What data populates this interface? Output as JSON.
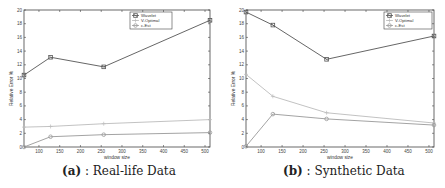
{
  "chart_data": [
    {
      "type": "line",
      "panel": "a",
      "title": "",
      "xlabel": "window size",
      "ylabel": "Relative Error %",
      "x": [
        64,
        128,
        256,
        512
      ],
      "xlim": [
        64,
        512
      ],
      "ylim": [
        0,
        20
      ],
      "xticks": [
        100,
        150,
        200,
        250,
        300,
        350,
        400,
        450,
        500
      ],
      "yticks": [
        0,
        2,
        4,
        6,
        8,
        10,
        12,
        14,
        16,
        18,
        20
      ],
      "grid": false,
      "legend_position": "upper center",
      "series": [
        {
          "name": "Wavelet",
          "values": [
            10.5,
            13.1,
            11.7,
            18.5
          ],
          "color": "#555555",
          "marker": "square"
        },
        {
          "name": "V-Optimal",
          "values": [
            2.9,
            3.0,
            3.4,
            4.0
          ],
          "color": "#bbbbbb",
          "marker": "plus"
        },
        {
          "name": "c-Est",
          "values": [
            0.0,
            1.5,
            1.8,
            2.1
          ],
          "color": "#999999",
          "marker": "circle"
        }
      ],
      "caption_label": "(a)",
      "caption_text": ": Real-life Data"
    },
    {
      "type": "line",
      "panel": "b",
      "title": "",
      "xlabel": "window size",
      "ylabel": "Relative Error %",
      "x": [
        64,
        128,
        256,
        512
      ],
      "xlim": [
        64,
        512
      ],
      "ylim": [
        0,
        20
      ],
      "xticks": [
        100,
        150,
        200,
        250,
        300,
        350,
        400,
        450,
        500
      ],
      "yticks": [
        0,
        2,
        4,
        6,
        8,
        10,
        12,
        14,
        16,
        18,
        20
      ],
      "grid": false,
      "legend_position": "upper right",
      "series": [
        {
          "name": "Wavelet",
          "values": [
            19.7,
            17.8,
            12.8,
            16.2
          ],
          "color": "#555555",
          "marker": "square"
        },
        {
          "name": "V-Optimal",
          "values": [
            10.6,
            7.4,
            5.0,
            3.5
          ],
          "color": "#bbbbbb",
          "marker": "plus"
        },
        {
          "name": "c-Est",
          "values": [
            0.1,
            4.8,
            4.1,
            3.2
          ],
          "color": "#999999",
          "marker": "circle"
        }
      ],
      "caption_label": "(b)",
      "caption_text": ": Synthetic Data"
    }
  ],
  "layout": {
    "panels": [
      {
        "id": "a",
        "axes": {
          "x0": 24,
          "x1": 210,
          "y0": 10,
          "y1": 147
        },
        "legend": {
          "x": 130,
          "y": 12,
          "w": 42,
          "h": 17
        }
      },
      {
        "id": "b",
        "axes": {
          "x0": 24,
          "x1": 212,
          "y0": 10,
          "y1": 147
        },
        "legend": {
          "x": 162,
          "y": 12,
          "w": 48,
          "h": 17
        }
      }
    ]
  }
}
